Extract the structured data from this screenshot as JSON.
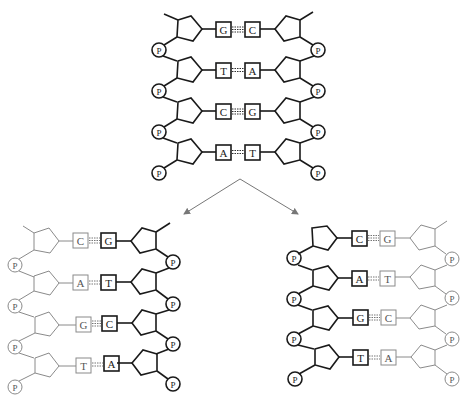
{
  "diagram": {
    "colors": {
      "old_strand": "#1a1a1a",
      "new_strand": "#8a8a8a",
      "arrow": "#777777",
      "background": "#ffffff"
    },
    "phosphate_label": "P",
    "parent": {
      "label": "parent-double-helix",
      "pairs": [
        {
          "left": "G",
          "right": "C"
        },
        {
          "left": "T",
          "right": "A"
        },
        {
          "left": "C",
          "right": "G"
        },
        {
          "left": "A",
          "right": "T"
        }
      ]
    },
    "daughters": [
      {
        "label": "daughter-left",
        "old_strand_side": "right",
        "pairs": [
          {
            "left": "C",
            "right": "G"
          },
          {
            "left": "A",
            "right": "T"
          },
          {
            "left": "G",
            "right": "C"
          },
          {
            "left": "T",
            "right": "A"
          }
        ]
      },
      {
        "label": "daughter-right",
        "old_strand_side": "left",
        "pairs": [
          {
            "left": "C",
            "right": "G"
          },
          {
            "left": "A",
            "right": "T"
          },
          {
            "left": "G",
            "right": "C"
          },
          {
            "left": "T",
            "right": "A"
          }
        ]
      }
    ]
  }
}
